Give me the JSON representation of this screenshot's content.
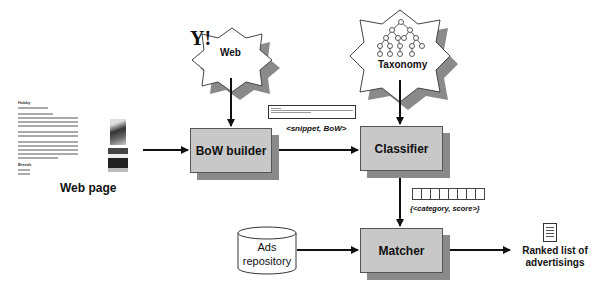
{
  "diagram": {
    "nodes": {
      "web_page": {
        "label": "Web page",
        "thumbnail": {
          "title": "Hobby",
          "section": "Breeds"
        }
      },
      "web": {
        "label": "Web",
        "logo": "Y!"
      },
      "taxonomy": {
        "label": "Taxonomy"
      },
      "bow_builder": {
        "label": "BoW builder"
      },
      "classifier": {
        "label": "Classifier"
      },
      "ads_repository": {
        "label_line1": "Ads",
        "label_line2": "repository"
      },
      "matcher": {
        "label": "Matcher"
      },
      "ranked_list": {
        "label_line1": "Ranked list of",
        "label_line2": "advertisings"
      }
    },
    "edge_labels": {
      "snippet_bow": "<snippet, BoW>",
      "category_score": "{<category, score>}"
    },
    "edges": [
      {
        "from": "web_page",
        "to": "bow_builder"
      },
      {
        "from": "web",
        "to": "bow_builder"
      },
      {
        "from": "bow_builder",
        "to": "classifier"
      },
      {
        "from": "taxonomy",
        "to": "classifier"
      },
      {
        "from": "classifier",
        "to": "matcher"
      },
      {
        "from": "ads_repository",
        "to": "matcher"
      },
      {
        "from": "matcher",
        "to": "ranked_list"
      }
    ],
    "colors": {
      "box_fill": "#c8c8c8",
      "box_shadow": "#8a8a8a",
      "line": "#111111"
    }
  }
}
